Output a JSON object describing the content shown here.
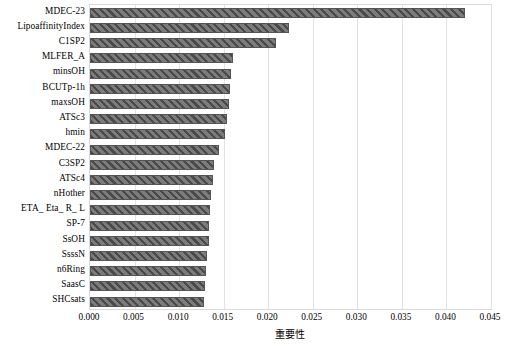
{
  "chart_data": {
    "type": "bar",
    "orientation": "horizontal",
    "title": "",
    "xlabel": "重要性",
    "ylabel": "",
    "xlim": [
      0.0,
      0.045
    ],
    "ylim": null,
    "grid": true,
    "legend": null,
    "xticks": [
      "0.000",
      "0.005",
      "0.010",
      "0.015",
      "0.020",
      "0.025",
      "0.030",
      "0.035",
      "0.040",
      "0.045"
    ],
    "xtick_values": [
      0.0,
      0.005,
      0.01,
      0.015,
      0.02,
      0.025,
      0.03,
      0.035,
      0.04,
      0.045
    ],
    "categories": [
      "MDEC-23",
      "LipoaffinityIndex",
      "C1SP2",
      "MLFER_A",
      "minsOH",
      "BCUTp-1h",
      "maxsOH",
      "ATSc3",
      "hmin",
      "MDEC-22",
      "C3SP2",
      "ATSc4",
      "nHother",
      "ETA_ Eta_ R_ L",
      "SP-7",
      "SsOH",
      "SsssN",
      "n6Ring",
      "SaasC",
      "SHCsats"
    ],
    "values": [
      0.0421,
      0.0223,
      0.0209,
      0.016,
      0.0158,
      0.0157,
      0.0156,
      0.0154,
      0.0152,
      0.0145,
      0.0139,
      0.0138,
      0.0136,
      0.0135,
      0.0134,
      0.0133,
      0.0131,
      0.013,
      0.0129,
      0.0128
    ],
    "series_name": "重要性",
    "bar_style": {
      "facecolor": "#6e6e6e",
      "hatch": "/",
      "hatchcolor": "#4a4a4a",
      "edgecolor": "#555555"
    },
    "colors": {
      "background": "#ffffff",
      "grid": "#e2e2e2",
      "frame": "#d9d9d9",
      "text": "#000000"
    }
  }
}
